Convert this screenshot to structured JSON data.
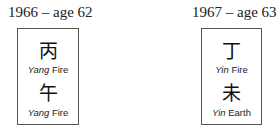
{
  "pillars": [
    {
      "title": "1966 – age 62",
      "stem": {
        "char": "丙",
        "polarity": "Yang",
        "element": "Fire"
      },
      "branch": {
        "char": "午",
        "polarity": "Yang",
        "element": "Fire"
      }
    },
    {
      "title": "1967 – age 63",
      "stem": {
        "char": "丁",
        "polarity": "Yin",
        "element": "Fire"
      },
      "branch": {
        "char": "未",
        "polarity": "Yin",
        "element": "Earth"
      }
    }
  ]
}
